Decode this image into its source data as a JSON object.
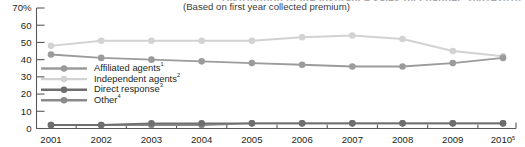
{
  "chart_data": {
    "type": "line",
    "title": "Distribution of life insurance sales by channel, 2001–2010",
    "subtitle": "(Based on first year collected premium)",
    "xlabel": "",
    "ylabel": "",
    "categories": [
      "2001",
      "2002",
      "2003",
      "2004",
      "2005",
      "2006",
      "2007",
      "2008",
      "2009",
      "2010"
    ],
    "x_tick_superscripts": [
      "",
      "",
      "",
      "",
      "",
      "",
      "",
      "",
      "",
      "5"
    ],
    "ylim": [
      0,
      70
    ],
    "y_ticks": [
      0,
      10,
      20,
      30,
      40,
      50,
      60,
      70
    ],
    "y_tick_labels": [
      "0",
      "10",
      "20",
      "30",
      "40",
      "50",
      "60",
      "70%"
    ],
    "y_unit": "%",
    "grid": false,
    "legend_position": "inside-left",
    "series": [
      {
        "name": "Affiliated agents",
        "superscript": "1",
        "color": "#9b9b9b",
        "values": [
          43,
          41,
          40,
          39,
          38,
          37,
          36,
          36,
          38,
          41
        ]
      },
      {
        "name": "Independent agents",
        "superscript": "2",
        "color": "#d2d2d2",
        "values": [
          48,
          51,
          51,
          51,
          51,
          53,
          54,
          52,
          45,
          42
        ]
      },
      {
        "name": "Direct response",
        "superscript": "3",
        "color": "#6e6e6e",
        "values": [
          2,
          2,
          3,
          3,
          3,
          3,
          3,
          3,
          3,
          3
        ]
      },
      {
        "name": "Other",
        "superscript": "4",
        "color": "#8a8a8a",
        "values": [
          2,
          2,
          2,
          2,
          3,
          3,
          3,
          3,
          3,
          3
        ]
      }
    ]
  },
  "legend": {
    "items": [
      {
        "label": "Affiliated agents",
        "superscript": "1"
      },
      {
        "label": "Independent agents",
        "superscript": "2"
      },
      {
        "label": "Direct response",
        "superscript": "3"
      },
      {
        "label": "Other",
        "superscript": "4"
      }
    ]
  },
  "colors": {
    "affiliated_agents": "#9b9b9b",
    "independent_agents": "#d2d2d2",
    "direct_response": "#6e6e6e",
    "other": "#8a8a8a",
    "axis": "#58595b",
    "text": "#231f20"
  }
}
